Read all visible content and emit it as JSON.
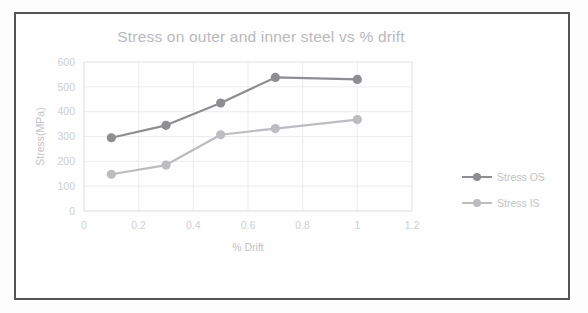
{
  "chart_data": {
    "type": "line",
    "title": "Stress on outer and inner steel vs % drift",
    "xlabel": "% Drift",
    "ylabel": "Stress(MPa)",
    "xlim": [
      0,
      1.2
    ],
    "ylim": [
      0,
      600
    ],
    "xticks": [
      "0",
      "0.2",
      "0.4",
      "0.6",
      "0.8",
      "1",
      "1.2"
    ],
    "yticks": [
      "0",
      "100",
      "200",
      "300",
      "400",
      "500",
      "600"
    ],
    "grid": true,
    "legend_position": "right",
    "x": [
      0.1,
      0.3,
      0.5,
      0.7,
      1.0
    ],
    "series": [
      {
        "name": "Stress OS",
        "color": "#8d8d92",
        "values": [
          295,
          345,
          435,
          538,
          530
        ]
      },
      {
        "name": "Stress IS",
        "color": "#bcbcc1",
        "values": [
          148,
          185,
          307,
          332,
          368
        ]
      }
    ]
  },
  "legend": {
    "items": [
      {
        "label": "Stress OS",
        "color": "#8d8d92"
      },
      {
        "label": "Stress IS",
        "color": "#bcbcc1"
      }
    ]
  }
}
